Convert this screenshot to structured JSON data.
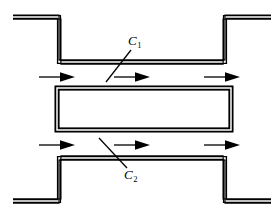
{
  "figure": {
    "name": "duct-flow-contour-diagram",
    "background_color": "#ffffff",
    "line_color": "#000000",
    "labels": [
      {
        "id": "c1",
        "text": "C",
        "subscript": "1"
      },
      {
        "id": "c2",
        "text": "C",
        "subscript": "2"
      }
    ],
    "arrows": {
      "count": 6,
      "direction": "right",
      "rows": [
        {
          "id": "upper-flow-row",
          "y": 77,
          "x_positions": [
            40,
            115,
            205
          ]
        },
        {
          "id": "lower-flow-row",
          "y": 145,
          "x_positions": [
            40,
            115,
            205
          ]
        }
      ]
    },
    "geometry": {
      "upper_wall": {
        "name": "upper-channel-wall",
        "points": "13,17 59,17 59,62 225,62 225,17 271,17"
      },
      "center_block": {
        "name": "center-block",
        "x": 57,
        "y": 88,
        "width": 174,
        "height": 42,
        "inner_inset": 5
      },
      "lower_wall": {
        "name": "lower-channel-wall",
        "points": "13,201 59,201 59,158 225,158 225,201 271,201"
      },
      "leader_lines": [
        {
          "name": "c1-leader-line",
          "x1": 131,
          "y1": 50,
          "x2": 106,
          "y2": 82
        },
        {
          "name": "c2-leader-line",
          "x1": 127,
          "y1": 168,
          "x2": 99,
          "y2": 138
        }
      ]
    }
  }
}
